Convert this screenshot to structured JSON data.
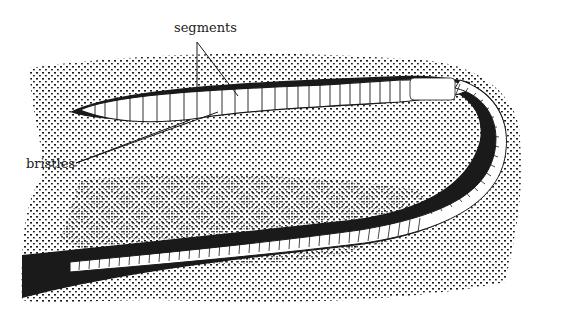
{
  "diagram": {
    "labels": {
      "segments": "segments",
      "bristles": "bristles"
    },
    "colors": {
      "ink": "#1a1a1a",
      "paper": "#ffffff"
    }
  }
}
